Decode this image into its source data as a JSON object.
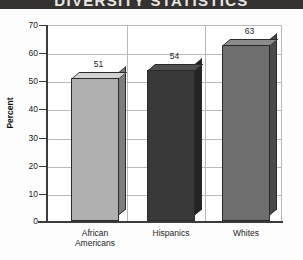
{
  "title": {
    "text": "DIVERSITY STATISTICS",
    "band_color": "#34332f",
    "text_color": "#e9e7e2"
  },
  "axis": {
    "ylabel": "Percent",
    "yticks": [
      "0",
      "10",
      "20",
      "30",
      "40",
      "50",
      "60",
      "70"
    ]
  },
  "chart_data": {
    "type": "bar",
    "title": "DIVERSITY STATISTICS",
    "xlabel": "",
    "ylabel": "Percent",
    "ylim": [
      0,
      70
    ],
    "ytick_step": 10,
    "grid": true,
    "legend": "none",
    "categories": [
      "African Americans",
      "Hispanics",
      "Whites"
    ],
    "category_lines": [
      [
        "African",
        "Americans"
      ],
      [
        "Hispanics"
      ],
      [
        "Whites"
      ]
    ],
    "values": [
      51,
      54,
      63
    ],
    "value_labels": [
      "51",
      "54",
      "63"
    ],
    "bar_colors": [
      "#b0b0b0",
      "#383838",
      "#6e6e6e"
    ],
    "bar_side_colors": [
      "#7d7d7d",
      "#232323",
      "#4a4a4a"
    ],
    "bar_top_colors": [
      "#d2d2d2",
      "#4e4e4e",
      "#8c8c8c"
    ],
    "style": "3d-bar"
  }
}
